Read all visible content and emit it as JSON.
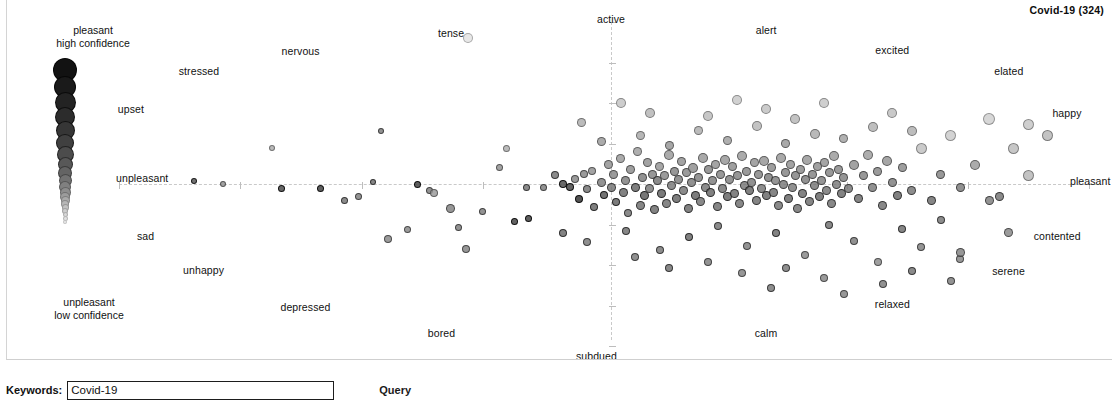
{
  "chart_title": "Covid-19 (324)",
  "legend": {
    "top_line1": "pleasant",
    "top_line2": "high confidence",
    "bottom_line1": "unpleasant",
    "bottom_line2": "low confidence"
  },
  "query": {
    "label": "Keywords:",
    "value": "Covid-19",
    "placeholder": "Covid-19",
    "button_label": "Query"
  },
  "chart_data": {
    "type": "scatter",
    "title": "Covid-19 (324)",
    "n_points": 324,
    "xlabel": "pleasant – unpleasant (valence)",
    "ylabel": "active – subdued (arousal)",
    "xlim": [
      -1,
      1
    ],
    "ylim": [
      -1,
      1
    ],
    "grid": false,
    "axis_style": "dashed crosshair through origin",
    "legend_position": "left column, size/darkness = confidence",
    "encoding": {
      "size": "confidence (larger = higher confidence)",
      "color": "grayscale darkness = confidence (darker = higher confidence)",
      "x": "valence: unpleasant (left) to pleasant (right)",
      "y": "arousal: subdued (bottom) to active (top)"
    },
    "anchors": [
      {
        "label": "active",
        "x": 0.0,
        "y": 1.02
      },
      {
        "label": "subdued",
        "x": -0.03,
        "y": -1.06
      },
      {
        "label": "pleasant",
        "x": 1.03,
        "y": 0.02
      },
      {
        "label": "unpleasant",
        "x": -1.04,
        "y": 0.04
      },
      {
        "label": "tense",
        "x": -0.33,
        "y": 0.93
      },
      {
        "label": "alert",
        "x": 0.32,
        "y": 0.95
      },
      {
        "label": "nervous",
        "x": -0.64,
        "y": 0.82
      },
      {
        "label": "excited",
        "x": 0.58,
        "y": 0.83
      },
      {
        "label": "stressed",
        "x": -0.85,
        "y": 0.7
      },
      {
        "label": "elated",
        "x": 0.82,
        "y": 0.7
      },
      {
        "label": "upset",
        "x": -0.99,
        "y": 0.46
      },
      {
        "label": "happy",
        "x": 0.94,
        "y": 0.44
      },
      {
        "label": "sad",
        "x": -0.96,
        "y": -0.32
      },
      {
        "label": "contented",
        "x": 0.92,
        "y": -0.32
      },
      {
        "label": "unhappy",
        "x": -0.84,
        "y": -0.53
      },
      {
        "label": "serene",
        "x": 0.82,
        "y": -0.54
      },
      {
        "label": "depressed",
        "x": -0.63,
        "y": -0.76
      },
      {
        "label": "relaxed",
        "x": 0.58,
        "y": -0.74
      },
      {
        "label": "bored",
        "x": -0.35,
        "y": -0.92
      },
      {
        "label": "calm",
        "x": 0.32,
        "y": -0.92
      }
    ],
    "legend_scale": {
      "label_top": "pleasant / high confidence",
      "label_bottom": "unpleasant / low confidence",
      "sizes": [
        24,
        22,
        21,
        20,
        19,
        18,
        17,
        15,
        14,
        13,
        12,
        11,
        10,
        9,
        8,
        7,
        6,
        5,
        5,
        4
      ],
      "grays": [
        18,
        26,
        35,
        44,
        54,
        64,
        76,
        88,
        100,
        114,
        128,
        142,
        156,
        170,
        182,
        194,
        206,
        216,
        226,
        236
      ]
    },
    "points": [
      [
        -0.475,
        0.33,
        6,
        120
      ],
      [
        -0.49,
        0.015,
        6,
        105
      ],
      [
        -0.4,
        0.0,
        7,
        55
      ],
      [
        -0.375,
        -0.04,
        7,
        120
      ],
      [
        -0.365,
        -0.055,
        8,
        150
      ],
      [
        -0.33,
        -0.15,
        9,
        125
      ],
      [
        -0.315,
        -0.27,
        7,
        120
      ],
      [
        -0.265,
        -0.17,
        7,
        120
      ],
      [
        -0.23,
        0.1,
        7,
        140
      ],
      [
        -0.175,
        -0.02,
        7,
        110
      ],
      [
        -0.14,
        -0.02,
        7,
        120
      ],
      [
        -0.215,
        0.22,
        7,
        170
      ],
      [
        -0.295,
        0.9,
        10,
        225
      ],
      [
        -0.115,
        0.055,
        8,
        110
      ],
      [
        -0.1,
        0.0,
        8,
        70
      ],
      [
        -0.085,
        -0.02,
        8,
        60
      ],
      [
        -0.075,
        0.03,
        8,
        130
      ],
      [
        -0.065,
        -0.09,
        8,
        40
      ],
      [
        -0.055,
        0.06,
        8,
        130
      ],
      [
        -0.05,
        -0.03,
        8,
        110
      ],
      [
        -0.04,
        0.08,
        8,
        140
      ],
      [
        -0.035,
        -0.14,
        8,
        95
      ],
      [
        -0.02,
        0.01,
        9,
        120
      ],
      [
        -0.015,
        -0.07,
        8,
        80
      ],
      [
        -0.005,
        0.12,
        9,
        140
      ],
      [
        0.0,
        -0.02,
        9,
        110
      ],
      [
        0.005,
        0.06,
        9,
        130
      ],
      [
        0.01,
        -0.11,
        8,
        90
      ],
      [
        0.02,
        0.16,
        9,
        150
      ],
      [
        0.025,
        -0.05,
        9,
        100
      ],
      [
        0.03,
        0.02,
        9,
        120
      ],
      [
        0.035,
        -0.18,
        8,
        110
      ],
      [
        0.04,
        0.09,
        9,
        135
      ],
      [
        0.05,
        -0.02,
        9,
        95
      ],
      [
        0.055,
        0.2,
        9,
        155
      ],
      [
        0.06,
        -0.13,
        9,
        105
      ],
      [
        0.065,
        0.04,
        9,
        120
      ],
      [
        0.07,
        -0.07,
        9,
        85
      ],
      [
        0.075,
        0.13,
        9,
        140
      ],
      [
        0.08,
        -0.03,
        9,
        115
      ],
      [
        0.085,
        0.06,
        9,
        125
      ],
      [
        0.09,
        -0.16,
        9,
        100
      ],
      [
        0.095,
        0.02,
        9,
        110
      ],
      [
        0.1,
        0.11,
        9,
        145
      ],
      [
        0.105,
        -0.06,
        9,
        90
      ],
      [
        0.11,
        0.05,
        9,
        130
      ],
      [
        0.115,
        -0.12,
        9,
        105
      ],
      [
        0.12,
        0.18,
        10,
        150
      ],
      [
        0.125,
        -0.01,
        9,
        115
      ],
      [
        0.13,
        0.08,
        9,
        125
      ],
      [
        0.135,
        -0.09,
        9,
        95
      ],
      [
        0.14,
        0.03,
        9,
        120
      ],
      [
        0.145,
        0.14,
        9,
        140
      ],
      [
        0.15,
        -0.04,
        9,
        110
      ],
      [
        0.155,
        0.07,
        9,
        130
      ],
      [
        0.16,
        -0.15,
        9,
        100
      ],
      [
        0.165,
        0.01,
        9,
        118
      ],
      [
        0.17,
        0.1,
        10,
        138
      ],
      [
        0.175,
        -0.07,
        9,
        92
      ],
      [
        0.18,
        0.04,
        9,
        122
      ],
      [
        0.185,
        -0.11,
        9,
        108
      ],
      [
        0.19,
        0.16,
        10,
        148
      ],
      [
        0.195,
        -0.02,
        9,
        112
      ],
      [
        0.2,
        0.09,
        9,
        128
      ],
      [
        0.205,
        -0.05,
        9,
        98
      ],
      [
        0.21,
        0.02,
        9,
        120
      ],
      [
        0.215,
        0.12,
        9,
        142
      ],
      [
        0.22,
        -0.14,
        9,
        104
      ],
      [
        0.225,
        0.06,
        9,
        126
      ],
      [
        0.23,
        -0.03,
        9,
        110
      ],
      [
        0.235,
        0.15,
        10,
        146
      ],
      [
        0.24,
        -0.08,
        9,
        94
      ],
      [
        0.245,
        0.03,
        9,
        122
      ],
      [
        0.25,
        0.11,
        9,
        136
      ],
      [
        0.255,
        -0.06,
        9,
        100
      ],
      [
        0.26,
        0.05,
        9,
        124
      ],
      [
        0.265,
        -0.12,
        9,
        106
      ],
      [
        0.27,
        0.17,
        10,
        150
      ],
      [
        0.275,
        -0.01,
        9,
        114
      ],
      [
        0.28,
        0.08,
        9,
        130
      ],
      [
        0.285,
        -0.04,
        9,
        96
      ],
      [
        0.29,
        0.01,
        9,
        118
      ],
      [
        0.295,
        0.13,
        9,
        144
      ],
      [
        0.3,
        -0.1,
        9,
        102
      ],
      [
        0.305,
        0.06,
        9,
        126
      ],
      [
        0.31,
        -0.03,
        9,
        112
      ],
      [
        0.315,
        0.14,
        10,
        145
      ],
      [
        0.32,
        -0.07,
        9,
        98
      ],
      [
        0.325,
        0.04,
        9,
        120
      ],
      [
        0.33,
        0.1,
        9,
        134
      ],
      [
        0.335,
        -0.05,
        9,
        104
      ],
      [
        0.34,
        0.02,
        9,
        122
      ],
      [
        0.345,
        -0.13,
        9,
        108
      ],
      [
        0.35,
        0.16,
        10,
        148
      ],
      [
        0.355,
        0.0,
        9,
        116
      ],
      [
        0.36,
        0.07,
        9,
        128
      ],
      [
        0.365,
        -0.09,
        9,
        96
      ],
      [
        0.37,
        0.12,
        9,
        140
      ],
      [
        0.375,
        -0.02,
        9,
        118
      ],
      [
        0.38,
        0.05,
        9,
        124
      ],
      [
        0.385,
        -0.15,
        9,
        106
      ],
      [
        0.39,
        0.09,
        9,
        132
      ],
      [
        0.395,
        -0.06,
        9,
        100
      ],
      [
        0.4,
        0.03,
        9,
        120
      ],
      [
        0.405,
        0.15,
        10,
        146
      ],
      [
        0.41,
        -0.11,
        9,
        104
      ],
      [
        0.415,
        0.06,
        9,
        126
      ],
      [
        0.42,
        -0.01,
        9,
        114
      ],
      [
        0.425,
        0.11,
        9,
        138
      ],
      [
        0.43,
        -0.08,
        9,
        98
      ],
      [
        0.435,
        0.02,
        9,
        122
      ],
      [
        0.44,
        0.13,
        9,
        142
      ],
      [
        0.445,
        -0.04,
        9,
        110
      ],
      [
        0.45,
        0.07,
        9,
        128
      ],
      [
        0.455,
        -0.12,
        9,
        106
      ],
      [
        0.46,
        0.17,
        10,
        150
      ],
      [
        0.465,
        0.0,
        9,
        116
      ],
      [
        0.47,
        0.09,
        9,
        130
      ],
      [
        0.475,
        -0.06,
        9,
        100
      ],
      [
        0.48,
        0.04,
        9,
        124
      ],
      [
        0.49,
        -0.03,
        9,
        112
      ],
      [
        0.5,
        0.12,
        10,
        140
      ],
      [
        0.51,
        -0.09,
        9,
        102
      ],
      [
        0.52,
        0.05,
        9,
        126
      ],
      [
        0.53,
        0.18,
        10,
        152
      ],
      [
        0.54,
        -0.02,
        9,
        118
      ],
      [
        0.55,
        0.08,
        9,
        130
      ],
      [
        0.56,
        -0.13,
        9,
        106
      ],
      [
        0.57,
        0.14,
        10,
        144
      ],
      [
        0.58,
        0.01,
        9,
        120
      ],
      [
        0.59,
        -0.07,
        9,
        98
      ],
      [
        0.6,
        0.1,
        9,
        134
      ],
      [
        0.62,
        -0.04,
        9,
        112
      ],
      [
        0.64,
        0.22,
        11,
        190
      ],
      [
        0.66,
        -0.1,
        9,
        104
      ],
      [
        0.68,
        0.06,
        9,
        126
      ],
      [
        0.7,
        0.3,
        11,
        200
      ],
      [
        0.72,
        -0.02,
        9,
        118
      ],
      [
        0.75,
        0.12,
        10,
        150
      ],
      [
        0.78,
        0.4,
        12,
        205
      ],
      [
        0.8,
        -0.08,
        9,
        110
      ],
      [
        0.83,
        0.22,
        11,
        185
      ],
      [
        0.86,
        0.37,
        11,
        195
      ],
      [
        0.9,
        0.3,
        11,
        180
      ],
      [
        -0.46,
        -0.34,
        8,
        130
      ],
      [
        -0.42,
        -0.28,
        7,
        130
      ],
      [
        -0.3,
        -0.4,
        8,
        125
      ],
      [
        -0.2,
        -0.23,
        7,
        60
      ],
      [
        -0.17,
        -0.21,
        7,
        55
      ],
      [
        -0.1,
        -0.3,
        8,
        100
      ],
      [
        -0.05,
        -0.36,
        8,
        115
      ],
      [
        0.03,
        -0.29,
        8,
        105
      ],
      [
        0.1,
        -0.41,
        8,
        112
      ],
      [
        0.16,
        -0.33,
        8,
        98
      ],
      [
        0.22,
        -0.26,
        8,
        110
      ],
      [
        0.28,
        -0.38,
        8,
        120
      ],
      [
        0.34,
        -0.3,
        8,
        100
      ],
      [
        0.4,
        -0.44,
        8,
        130
      ],
      [
        0.45,
        -0.25,
        8,
        108
      ],
      [
        0.5,
        -0.35,
        8,
        118
      ],
      [
        0.55,
        -0.48,
        8,
        135
      ],
      [
        0.6,
        -0.28,
        8,
        104
      ],
      [
        0.64,
        -0.39,
        8,
        122
      ],
      [
        0.68,
        -0.22,
        8,
        112
      ],
      [
        0.72,
        -0.46,
        8,
        128
      ],
      [
        0.36,
        -0.52,
        8,
        115
      ],
      [
        0.27,
        -0.55,
        8,
        125
      ],
      [
        0.44,
        -0.58,
        8,
        130
      ],
      [
        0.56,
        -0.62,
        8,
        118
      ],
      [
        0.62,
        -0.54,
        8,
        110
      ],
      [
        0.2,
        -0.48,
        8,
        120
      ],
      [
        0.12,
        -0.52,
        8,
        108
      ],
      [
        0.05,
        -0.45,
        8,
        116
      ],
      [
        0.48,
        -0.68,
        8,
        126
      ],
      [
        0.33,
        -0.64,
        8,
        114
      ],
      [
        0.7,
        -0.6,
        8,
        120
      ],
      [
        -0.02,
        0.26,
        9,
        150
      ],
      [
        0.06,
        0.3,
        9,
        165
      ],
      [
        0.12,
        0.24,
        9,
        145
      ],
      [
        0.18,
        0.33,
        9,
        170
      ],
      [
        0.24,
        0.27,
        9,
        155
      ],
      [
        0.3,
        0.36,
        10,
        180
      ],
      [
        0.36,
        0.25,
        9,
        148
      ],
      [
        0.42,
        0.31,
        10,
        168
      ],
      [
        0.48,
        0.28,
        9,
        158
      ],
      [
        0.54,
        0.35,
        10,
        175
      ],
      [
        0.2,
        0.42,
        10,
        185
      ],
      [
        0.32,
        0.46,
        10,
        190
      ],
      [
        0.08,
        0.44,
        10,
        178
      ],
      [
        0.44,
        0.5,
        10,
        195
      ],
      [
        0.58,
        0.44,
        10,
        188
      ],
      [
        0.26,
        0.52,
        10,
        198
      ],
      [
        -0.06,
        0.38,
        9,
        170
      ],
      [
        0.02,
        0.5,
        10,
        192
      ],
      [
        0.62,
        0.33,
        10,
        172
      ],
      [
        0.38,
        0.4,
        10,
        180
      ],
      [
        0.86,
        0.05,
        11,
        180
      ],
      [
        0.78,
        -0.1,
        9,
        120
      ],
      [
        0.82,
        -0.3,
        9,
        130
      ],
      [
        0.72,
        -0.42,
        9,
        125
      ],
      [
        -0.68,
        -0.03,
        7,
        65
      ],
      [
        -0.6,
        -0.03,
        7,
        55
      ],
      [
        -0.7,
        0.22,
        6,
        170
      ],
      [
        -0.55,
        -0.1,
        7,
        110
      ],
      [
        -0.52,
        -0.08,
        7,
        120
      ],
      [
        -0.8,
        0.0,
        6,
        140
      ],
      [
        -0.86,
        0.02,
        6,
        80
      ]
    ]
  }
}
